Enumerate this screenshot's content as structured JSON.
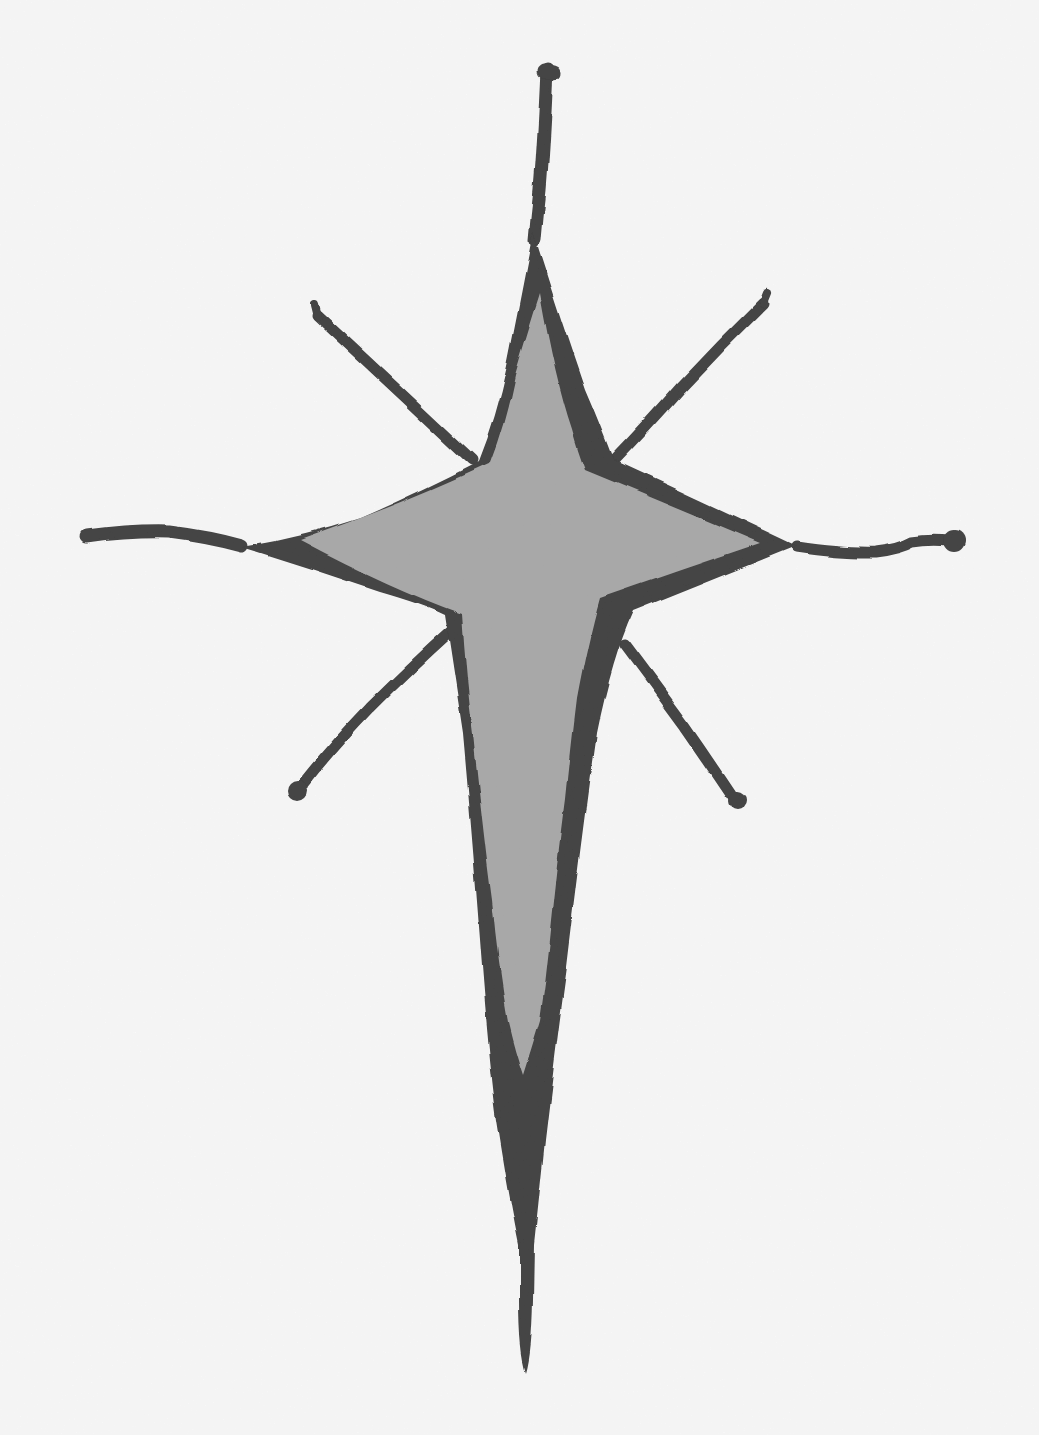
{
  "artwork": {
    "subject": "four-pointed star clip art with radiating rays",
    "background_color": "#fefefe",
    "outline_color": "#3a3a3a",
    "fill_color": "#a9a9a9",
    "elements": {
      "star": "four-pointed star with elongated tapering bottom point and thin bottom tail",
      "rays": [
        "top-ray",
        "upper-left-ray",
        "upper-right-ray",
        "left-ray",
        "right-ray",
        "lower-left-ray",
        "lower-right-ray"
      ]
    }
  }
}
